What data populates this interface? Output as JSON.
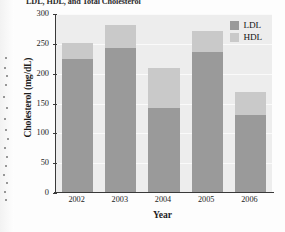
{
  "chart_data": {
    "type": "bar",
    "subtype": "stacked-bar",
    "title": "LDL, HDL, and Total Cholesterol",
    "xlabel": "Year",
    "ylabel": "Cholesterol (mg/dL)",
    "categories": [
      "2002",
      "2003",
      "2004",
      "2005",
      "2006"
    ],
    "series": [
      {
        "name": "LDL",
        "color": "#9a9a9a",
        "values": [
          225,
          243,
          142,
          237,
          131
        ]
      },
      {
        "name": "HDL",
        "color": "#c9c9c9",
        "values": [
          27,
          39,
          68,
          34,
          39
        ]
      }
    ],
    "totals": [
      252,
      282,
      210,
      271,
      170
    ],
    "ylim": [
      0,
      300
    ],
    "yticks": [
      0,
      50,
      100,
      150,
      200,
      250,
      300
    ],
    "ytick_labels": [
      "0",
      "50",
      "100",
      "150",
      "200",
      "250",
      "300"
    ],
    "grid": true,
    "legend_position": "top-right-inside",
    "legend_entries": [
      "LDL",
      "HDL"
    ]
  },
  "legend": {
    "ldl_label": "LDL",
    "hdl_label": "HDL"
  },
  "axes": {
    "y_title": "Cholesterol (mg/dL)",
    "x_title": "Year"
  }
}
